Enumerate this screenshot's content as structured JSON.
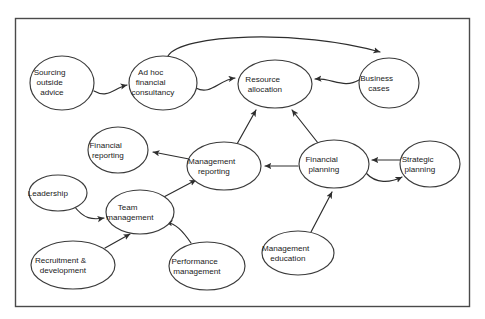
{
  "diagram": {
    "frame": {
      "x": 15,
      "y": 18,
      "width": 455,
      "height": 289,
      "stroke": "#4a4a4a"
    },
    "style": {
      "node_fill": "#ffffff",
      "node_stroke": "#3b3b3b",
      "edge_stroke": "#2e2e2e",
      "text_color": "#1a1a1a",
      "background": "#ffffff"
    },
    "nodes": [
      {
        "id": "sourcing-outside-advice",
        "label": "Sourcing outside advice",
        "lines": [
          "Sourcing",
          "outside",
          "advice"
        ],
        "cx": 62,
        "cy": 83,
        "rx": 32,
        "ry": 27
      },
      {
        "id": "ad-hoc-financial-consultancy",
        "label": "Ad hoc financial consultancy",
        "lines": [
          "Ad hoc",
          "financial",
          "consultancy"
        ],
        "cx": 163,
        "cy": 83,
        "rx": 34,
        "ry": 27
      },
      {
        "id": "resource-allocation",
        "label": "Resource allocation",
        "lines": [
          "Resource",
          "allocation"
        ],
        "cx": 275,
        "cy": 84,
        "rx": 37,
        "ry": 24
      },
      {
        "id": "business-cases",
        "label": "Business cases",
        "lines": [
          "Business",
          "cases"
        ],
        "cx": 389,
        "cy": 83,
        "rx": 30,
        "ry": 25
      },
      {
        "id": "financial-reporting",
        "label": "Financial reporting",
        "lines": [
          "Financial",
          "reporting"
        ],
        "cx": 118,
        "cy": 150,
        "rx": 30,
        "ry": 23
      },
      {
        "id": "management-reporting",
        "label": "Management reporting",
        "lines": [
          "Management",
          "reporting"
        ],
        "cx": 224,
        "cy": 166,
        "rx": 37,
        "ry": 24
      },
      {
        "id": "financial-planning",
        "label": "Financial planning",
        "lines": [
          "Financial",
          "planning"
        ],
        "cx": 334,
        "cy": 164,
        "rx": 35,
        "ry": 24
      },
      {
        "id": "strategic-planning",
        "label": "Strategic planning",
        "lines": [
          "Strategic",
          "planning"
        ],
        "cx": 430,
        "cy": 164,
        "rx": 30,
        "ry": 23
      },
      {
        "id": "leadership",
        "label": "Leadership",
        "lines": [
          "Leadership"
        ],
        "cx": 58,
        "cy": 193,
        "rx": 29,
        "ry": 18
      },
      {
        "id": "team-management",
        "label": "Team management",
        "lines": [
          "Team",
          "management"
        ],
        "cx": 140,
        "cy": 212,
        "rx": 34,
        "ry": 22
      },
      {
        "id": "recruitment-development",
        "label": "Recruitment & development",
        "lines": [
          "Recruitment &",
          "development"
        ],
        "cx": 73,
        "cy": 265,
        "rx": 42,
        "ry": 24
      },
      {
        "id": "performance-management",
        "label": "Performance management",
        "lines": [
          "Performance",
          "management"
        ],
        "cx": 207,
        "cy": 266,
        "rx": 38,
        "ry": 24
      },
      {
        "id": "management-education",
        "label": "Management education",
        "lines": [
          "Management",
          "education"
        ],
        "cx": 298,
        "cy": 253,
        "rx": 36,
        "ry": 22
      }
    ],
    "edges": [
      {
        "id": "sourcing-to-adhoc",
        "from": "sourcing-outside-advice",
        "to": "ad hoc financial consultancy",
        "arrow": "single"
      },
      {
        "id": "adhoc-to-resource",
        "from": "ad-hoc-financial-consultancy",
        "to": "resource-allocation",
        "arrow": "single"
      },
      {
        "id": "adhoc-to-business-cases",
        "from": "ad-hoc-financial-consultancy",
        "to": "business-cases",
        "arrow": "single"
      },
      {
        "id": "business-cases-to-resource",
        "from": "business-cases",
        "to": "resource-allocation",
        "arrow": "single"
      },
      {
        "id": "management-reporting-to-resource",
        "from": "management-reporting",
        "to": "resource-allocation",
        "arrow": "single"
      },
      {
        "id": "financial-planning-to-resource",
        "from": "financial-planning",
        "to": "resource-allocation",
        "arrow": "single"
      },
      {
        "id": "management-reporting-to-financial-reporting",
        "from": "management-reporting",
        "to": "financial-reporting",
        "arrow": "single"
      },
      {
        "id": "financial-planning-to-management-reporting",
        "from": "financial-planning",
        "to": "management-reporting",
        "arrow": "single"
      },
      {
        "id": "strategic-to-financial-planning",
        "from": "strategic-planning",
        "to": "financial-planning",
        "arrow": "single"
      },
      {
        "id": "financial-planning-to-strategic",
        "from": "financial-planning",
        "to": "strategic-planning",
        "arrow": "single"
      },
      {
        "id": "management-education-to-financial-planning",
        "from": "management-education",
        "to": "financial-planning",
        "arrow": "single"
      },
      {
        "id": "team-management-to-management-reporting",
        "from": "team-management",
        "to": "management-reporting",
        "arrow": "single"
      },
      {
        "id": "leadership-to-team-management",
        "from": "leadership",
        "to": "team-management",
        "arrow": "single"
      },
      {
        "id": "recruitment-to-team-management",
        "from": "recruitment-development",
        "to": "team-management",
        "arrow": "single"
      },
      {
        "id": "performance-to-team-management",
        "from": "performance-management",
        "to": "team-management",
        "arrow": "single"
      }
    ]
  }
}
